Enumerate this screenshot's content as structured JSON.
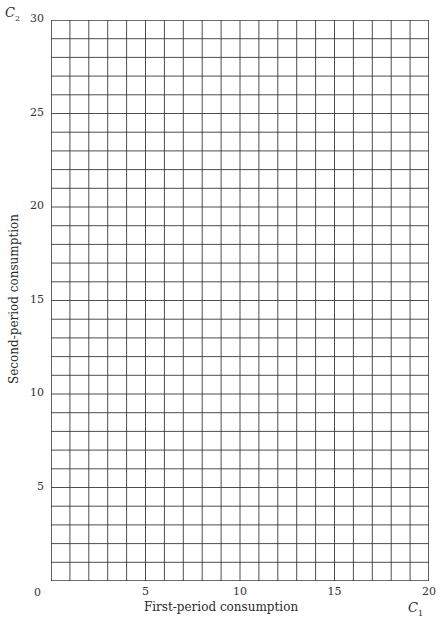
{
  "chart_data": {
    "type": "scatter",
    "title": "",
    "xlabel": "First-period consumption",
    "ylabel": "Second-period consumption",
    "x_var": "C",
    "x_var_sub": "1",
    "y_var": "C",
    "y_var_sub": "2",
    "xlim": [
      0,
      20
    ],
    "ylim": [
      0,
      30
    ],
    "x_ticks": [
      0,
      5,
      10,
      15,
      20
    ],
    "y_ticks": [
      5,
      10,
      15,
      20,
      25,
      30
    ],
    "grid": true,
    "grid_x_step": 1,
    "grid_y_step": 1,
    "series": []
  },
  "labels": {
    "origin": "0",
    "x_ticks": [
      "5",
      "10",
      "15",
      "20"
    ],
    "y_ticks": [
      "5",
      "10",
      "15",
      "20",
      "25",
      "30"
    ]
  },
  "colors": {
    "grid": "#3a3a3a",
    "text": "#2a2a2a"
  }
}
